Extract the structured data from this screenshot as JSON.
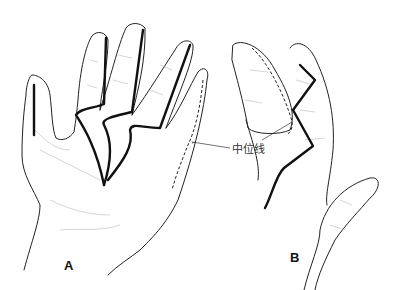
{
  "figure": {
    "panels": [
      {
        "id": "A",
        "label": "A",
        "description": "Palmar view of hand with zigzag/midline incisions on fingers"
      },
      {
        "id": "B",
        "label": "B",
        "description": "Lateral view of flexed finger with zigzag incision and midline"
      }
    ],
    "annotation": {
      "text": "中位线"
    },
    "colors": {
      "line": "#222222",
      "incision": "#111111",
      "shade": "#b8b8b8",
      "background": "#ffffff"
    }
  }
}
